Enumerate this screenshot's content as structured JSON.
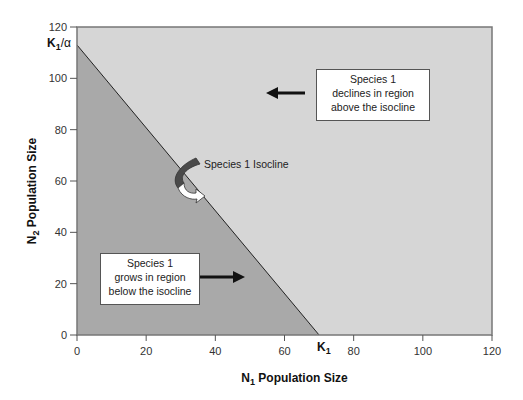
{
  "chart_data": {
    "type": "line",
    "title": "",
    "xlabel": "N",
    "xlabel_sub": "1",
    "xlabel_rest": " Population Size",
    "ylabel": "N",
    "ylabel_sub": "2",
    "ylabel_rest": " Population Size",
    "xlim": [
      0,
      120
    ],
    "ylim": [
      0,
      120
    ],
    "x_ticks": [
      0,
      20,
      40,
      60,
      80,
      100,
      120
    ],
    "y_ticks": [
      0,
      20,
      40,
      60,
      80,
      100,
      120
    ],
    "series": [
      {
        "name": "Species 1 Isocline",
        "points": [
          [
            0,
            113
          ],
          [
            70,
            0
          ]
        ]
      }
    ],
    "regions": [
      {
        "name": "below-isocline",
        "color": "#a9a9a9"
      },
      {
        "name": "above-isocline",
        "color": "#d6d6d6"
      }
    ],
    "annotations": {
      "k1_alpha": {
        "main": "K",
        "sub": "1",
        "rest": "/α",
        "y": 113
      },
      "k1": {
        "main": "K",
        "sub": "1",
        "x": 70
      },
      "decline_box": [
        "Species 1",
        "declines in region",
        "above the isocline"
      ],
      "grow_box": [
        "Species 1",
        "grows in region",
        "below the isocline"
      ],
      "isocline_label": "Species 1 Isocline"
    }
  }
}
